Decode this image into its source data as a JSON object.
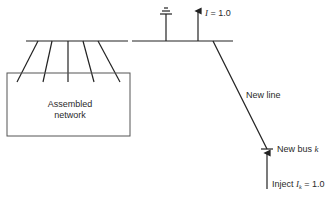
{
  "diagram": {
    "assembled_network": {
      "label_line1": "Assembled",
      "label_line2": "network"
    },
    "reference_current": {
      "symbol": "I",
      "equals": " = 1.0"
    },
    "new_line_label": "New line",
    "new_bus": {
      "prefix": "New bus ",
      "symbol": "k"
    },
    "injection": {
      "prefix": "Inject ",
      "symbol": "I",
      "subscript": "k",
      "equals": " = 1.0"
    },
    "colors": {
      "line": "#222222",
      "text": "#2a2a2a",
      "background": "#ffffff"
    }
  }
}
